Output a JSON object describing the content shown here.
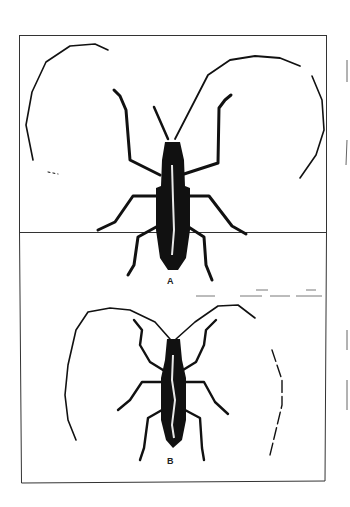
{
  "figure": {
    "type": "scientific-illustration",
    "panels": [
      {
        "id": "A",
        "label": "A"
      },
      {
        "id": "B",
        "label": "B"
      }
    ],
    "colors": {
      "ink": "#111111",
      "paper": "#ffffff",
      "frame": "#333333"
    }
  }
}
